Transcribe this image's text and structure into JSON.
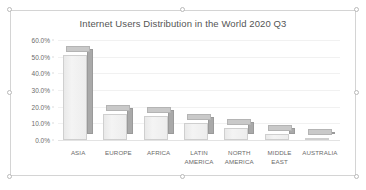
{
  "chart_object": {
    "selected": true,
    "handle_names": [
      "top-left",
      "top-center",
      "top-right",
      "middle-left",
      "middle-right",
      "bottom-left",
      "bottom-center",
      "bottom-right"
    ]
  },
  "chart_data": {
    "type": "bar",
    "title": "Internet Users Distribution in the World 2020 Q3",
    "xlabel": "",
    "ylabel": "",
    "ylim": [
      0,
      60
    ],
    "grid": true,
    "legend": "none",
    "style": "3-D clustered column",
    "categories": [
      "ASIA",
      "EUROPE",
      "AFRICA",
      "LATIN AMERICA",
      "NORTH AMERICA",
      "MIDDLE EAST",
      "AUSTRALIA"
    ],
    "category_lines": [
      [
        "ASIA"
      ],
      [
        "EUROPE"
      ],
      [
        "AFRICA"
      ],
      [
        "LATIN",
        "AMERICA"
      ],
      [
        "NORTH",
        "AMERICA"
      ],
      [
        "MIDDLE",
        "EAST"
      ],
      [
        "AUSTRALIA"
      ]
    ],
    "values": [
      50.9,
      15.9,
      14.7,
      10.1,
      7.5,
      3.9,
      0.6
    ],
    "value_labels": [
      "50.9%",
      "15.9%",
      "14.7%",
      "10.1%",
      "7.5%",
      "3.9%",
      "0.6%"
    ],
    "yticks": [
      0,
      10,
      20,
      30,
      40,
      50,
      60
    ],
    "ytick_labels": [
      "0.0%",
      "10.0%",
      "20.0%",
      "30.0%",
      "40.0%",
      "50.0%",
      "60.0%"
    ],
    "colors": {
      "bar_front": "#f0f0f0",
      "bar_side": "#a9a9a9",
      "bar_top": "#c9c9c9",
      "gridline": "#f1f1f1",
      "text": "#6b6b6b",
      "title_text": "#555555",
      "frame_border": "#d4d4d4"
    }
  }
}
